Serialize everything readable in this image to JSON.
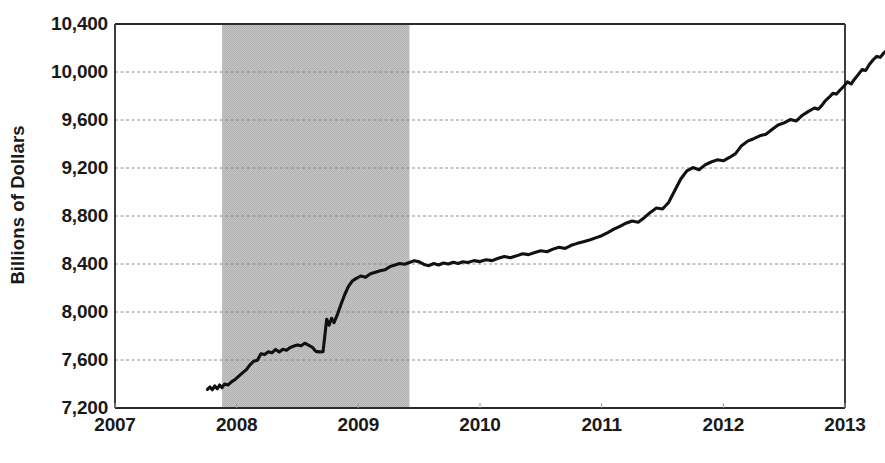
{
  "chart_data": {
    "type": "line",
    "title": "",
    "subtitle": "",
    "xlabel": "",
    "ylabel": "Billions of Dollars",
    "xlim": [
      2007.0,
      2013.0
    ],
    "ylim": [
      7200,
      10400
    ],
    "y_ticks": [
      7200,
      7600,
      8000,
      8400,
      8800,
      9200,
      9600,
      10000,
      10400
    ],
    "y_tick_labels": [
      "7,200",
      "7,600",
      "8,000",
      "8,400",
      "8,800",
      "9,200",
      "9,600",
      "10,000",
      "10,400"
    ],
    "x_ticks": [
      2007,
      2008,
      2009,
      2010,
      2011,
      2012,
      2013
    ],
    "x_tick_labels": [
      "2007",
      "2008",
      "2009",
      "2010",
      "2011",
      "2012",
      "2013"
    ],
    "grid": "horizontal-dashed",
    "legend": "none",
    "line_color": "#111111",
    "line_width": 3.1,
    "shaded_regions": [
      {
        "name": "recession-band",
        "x_start": 2007.88,
        "x_end": 2009.42,
        "color": "#bfbfbf",
        "label": ""
      }
    ],
    "series": [
      {
        "name": "Commercial and Industrial Loans",
        "color": "#111111",
        "points": [
          [
            2007.76,
            7355
          ],
          [
            2007.78,
            7375
          ],
          [
            2007.8,
            7352
          ],
          [
            2007.82,
            7384
          ],
          [
            2007.84,
            7360
          ],
          [
            2007.86,
            7392
          ],
          [
            2007.88,
            7370
          ],
          [
            2007.9,
            7400
          ],
          [
            2007.93,
            7392
          ],
          [
            2007.96,
            7420
          ],
          [
            2007.99,
            7440
          ],
          [
            2008.02,
            7468
          ],
          [
            2008.05,
            7495
          ],
          [
            2008.08,
            7520
          ],
          [
            2008.11,
            7560
          ],
          [
            2008.14,
            7590
          ],
          [
            2008.17,
            7598
          ],
          [
            2008.2,
            7652
          ],
          [
            2008.23,
            7645
          ],
          [
            2008.26,
            7668
          ],
          [
            2008.29,
            7660
          ],
          [
            2008.32,
            7688
          ],
          [
            2008.35,
            7666
          ],
          [
            2008.38,
            7690
          ],
          [
            2008.41,
            7682
          ],
          [
            2008.44,
            7704
          ],
          [
            2008.47,
            7716
          ],
          [
            2008.5,
            7726
          ],
          [
            2008.53,
            7718
          ],
          [
            2008.56,
            7740
          ],
          [
            2008.59,
            7724
          ],
          [
            2008.62,
            7708
          ],
          [
            2008.65,
            7672
          ],
          [
            2008.68,
            7668
          ],
          [
            2008.71,
            7670
          ],
          [
            2008.74,
            7940
          ],
          [
            2008.76,
            7890
          ],
          [
            2008.78,
            7948
          ],
          [
            2008.8,
            7912
          ],
          [
            2008.83,
            7985
          ],
          [
            2008.86,
            8070
          ],
          [
            2008.89,
            8150
          ],
          [
            2008.92,
            8215
          ],
          [
            2008.95,
            8258
          ],
          [
            2008.98,
            8278
          ],
          [
            2009.02,
            8300
          ],
          [
            2009.06,
            8290
          ],
          [
            2009.1,
            8318
          ],
          [
            2009.14,
            8332
          ],
          [
            2009.18,
            8344
          ],
          [
            2009.22,
            8352
          ],
          [
            2009.26,
            8378
          ],
          [
            2009.3,
            8392
          ],
          [
            2009.34,
            8404
          ],
          [
            2009.38,
            8398
          ],
          [
            2009.42,
            8412
          ],
          [
            2009.46,
            8428
          ],
          [
            2009.5,
            8418
          ],
          [
            2009.54,
            8396
          ],
          [
            2009.58,
            8386
          ],
          [
            2009.62,
            8404
          ],
          [
            2009.66,
            8392
          ],
          [
            2009.7,
            8408
          ],
          [
            2009.74,
            8400
          ],
          [
            2009.78,
            8414
          ],
          [
            2009.82,
            8404
          ],
          [
            2009.86,
            8418
          ],
          [
            2009.9,
            8412
          ],
          [
            2009.95,
            8428
          ],
          [
            2010.0,
            8420
          ],
          [
            2010.05,
            8436
          ],
          [
            2010.1,
            8428
          ],
          [
            2010.15,
            8448
          ],
          [
            2010.2,
            8462
          ],
          [
            2010.25,
            8452
          ],
          [
            2010.3,
            8468
          ],
          [
            2010.35,
            8486
          ],
          [
            2010.4,
            8478
          ],
          [
            2010.45,
            8496
          ],
          [
            2010.5,
            8510
          ],
          [
            2010.55,
            8502
          ],
          [
            2010.6,
            8524
          ],
          [
            2010.65,
            8540
          ],
          [
            2010.7,
            8530
          ],
          [
            2010.75,
            8556
          ],
          [
            2010.8,
            8572
          ],
          [
            2010.85,
            8586
          ],
          [
            2010.9,
            8600
          ],
          [
            2010.95,
            8618
          ],
          [
            2011.0,
            8636
          ],
          [
            2011.05,
            8662
          ],
          [
            2011.1,
            8690
          ],
          [
            2011.15,
            8714
          ],
          [
            2011.2,
            8740
          ],
          [
            2011.25,
            8758
          ],
          [
            2011.3,
            8748
          ],
          [
            2011.35,
            8786
          ],
          [
            2011.4,
            8830
          ],
          [
            2011.45,
            8866
          ],
          [
            2011.5,
            8858
          ],
          [
            2011.55,
            8912
          ],
          [
            2011.6,
            9010
          ],
          [
            2011.65,
            9108
          ],
          [
            2011.7,
            9176
          ],
          [
            2011.75,
            9204
          ],
          [
            2011.8,
            9186
          ],
          [
            2011.85,
            9226
          ],
          [
            2011.9,
            9250
          ],
          [
            2011.95,
            9268
          ],
          [
            2012.0,
            9260
          ],
          [
            2012.05,
            9288
          ],
          [
            2012.1,
            9320
          ],
          [
            2012.15,
            9386
          ],
          [
            2012.2,
            9424
          ],
          [
            2012.25,
            9444
          ],
          [
            2012.3,
            9468
          ],
          [
            2012.35,
            9482
          ],
          [
            2012.4,
            9520
          ],
          [
            2012.45,
            9558
          ],
          [
            2012.5,
            9576
          ],
          [
            2012.55,
            9604
          ],
          [
            2012.6,
            9592
          ],
          [
            2012.65,
            9640
          ],
          [
            2012.7,
            9672
          ],
          [
            2012.75,
            9700
          ],
          [
            2012.78,
            9690
          ],
          [
            2012.81,
            9722
          ],
          [
            2012.84,
            9762
          ],
          [
            2012.87,
            9790
          ],
          [
            2012.9,
            9822
          ],
          [
            2012.93,
            9816
          ],
          [
            2012.96,
            9850
          ],
          [
            2012.99,
            9880
          ],
          [
            2013.02,
            9918
          ],
          [
            2013.05,
            9900
          ],
          [
            2013.08,
            9942
          ],
          [
            2013.11,
            9980
          ],
          [
            2013.14,
            10020
          ],
          [
            2013.17,
            10012
          ],
          [
            2013.2,
            10062
          ],
          [
            2013.23,
            10100
          ],
          [
            2013.26,
            10130
          ],
          [
            2013.29,
            10122
          ],
          [
            2013.32,
            10160
          ],
          [
            2013.35,
            10182
          ]
        ]
      }
    ]
  },
  "axis": {
    "y_title": "Billions of Dollars"
  }
}
